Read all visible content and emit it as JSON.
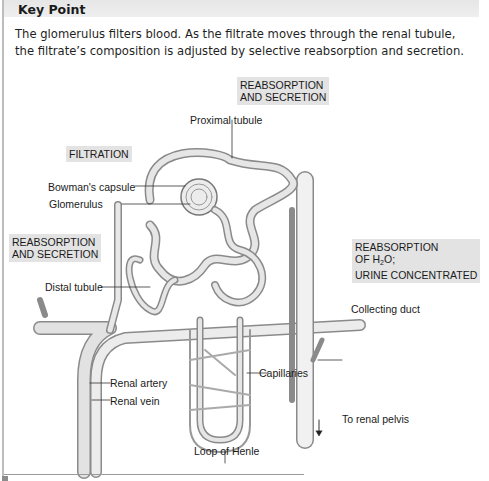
{
  "header": {
    "title": "Key Point"
  },
  "intro": {
    "line1": "The glomerulus filters blood. As the filtrate moves through the renal tubule,",
    "line2": "the filtrate’s composition is adjusted by selective reabsorption and secretion."
  },
  "process_boxes": {
    "proximal": {
      "line1": "REABSORPTION",
      "line2": "AND SECRETION"
    },
    "filtration": {
      "line1": "FILTRATION"
    },
    "distal": {
      "line1": "REABSORPTION",
      "line2": "AND SECRETION"
    },
    "collecting": {
      "line1": "REABSORPTION",
      "line2_prefix": "OF H",
      "line2_sub": "2",
      "line2_suffix": "O;",
      "line3": "URINE CONCENTRATED"
    }
  },
  "labels": {
    "proximal_tubule": "Proximal tubule",
    "bowmans_capsule": "Bowman's capsule",
    "glomerulus": "Glomerulus",
    "distal_tubule": "Distal tubule",
    "collecting_duct": "Collecting duct",
    "capillaries": "Capillaries",
    "renal_artery": "Renal artery",
    "renal_vein": "Renal vein",
    "to_renal_pelvis": "To renal pelvis",
    "loop_of_henle": "Loop of Henle"
  },
  "colors": {
    "box_fill": "#e3e3e3",
    "header_fill": "#e9e9e9",
    "vessel": "#d8d8d8",
    "outline": "#8a8a8a"
  }
}
